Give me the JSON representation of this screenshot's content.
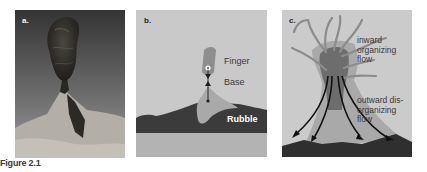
{
  "figure": {
    "caption": "Figure 2.1",
    "panels": [
      {
        "label": "a.",
        "description": "photograph of a rock finger on a rubble base",
        "colors": {
          "sky_top": "#3a3a3a",
          "sky_bottom": "#8a8a8a",
          "ground": "#b5b2ab",
          "rock": "#2a2824"
        }
      },
      {
        "label": "b.",
        "annotations": {
          "finger": "Finger",
          "base": "Base",
          "rubble": "Rubble"
        },
        "colors": {
          "background": "#c8c8c8",
          "finger": "#8f8f8f",
          "base": "#a8a8a8",
          "rubble": "#3c3c3c",
          "ground": "#b5b5b5",
          "marker": "#1e1e1e"
        }
      },
      {
        "label": "c.",
        "annotations": {
          "inward": [
            "inward",
            "organizing",
            "flow"
          ],
          "outward": [
            "outward dis-",
            "organizing",
            "flow"
          ]
        },
        "colors": {
          "background": "#cbcbcb",
          "column": "#6e6e6e",
          "halo": "#a9a9a9",
          "tendrils": "#8c8c8c",
          "arrows": "#111111",
          "ground": "#2f2f2f"
        }
      }
    ]
  }
}
